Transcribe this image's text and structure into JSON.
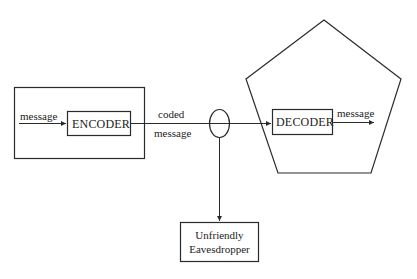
{
  "diagram": {
    "sender": {
      "input_label": "message",
      "encoder_label": "ENCODER"
    },
    "channel": {
      "label_line1": "coded",
      "label_line2": "message"
    },
    "receiver": {
      "decoder_label": "DECODER",
      "output_label": "message"
    },
    "eavesdropper": {
      "line1": "Unfriendly",
      "line2": "Eavesdropper"
    },
    "colors": {
      "stroke": "#2a2a2a",
      "background": "#ffffff"
    }
  }
}
